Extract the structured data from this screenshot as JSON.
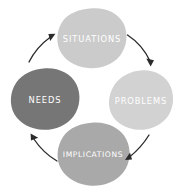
{
  "diagram": {
    "type": "cycle-diagram",
    "background_color": "#ffffff",
    "label_color": "#ffffff",
    "arrow_color": "#2b2b2b",
    "nodes": [
      {
        "id": "situations",
        "label": "SITUATIONS",
        "position": "top",
        "color": "#cbcbcb",
        "cx": 92,
        "cy": 38,
        "rx": 34,
        "ry": 30
      },
      {
        "id": "problems",
        "label": "PROBLEMS",
        "position": "right",
        "color": "#d2d2d2",
        "cx": 141,
        "cy": 100,
        "rx": 31,
        "ry": 30
      },
      {
        "id": "implications",
        "label": "IMPLICATIONS",
        "position": "bottom",
        "color": "#a9a9a9",
        "cx": 93,
        "cy": 154,
        "rx": 35,
        "ry": 31
      },
      {
        "id": "needs",
        "label": "NEEDS",
        "position": "left",
        "color": "#767676",
        "cx": 45,
        "cy": 99,
        "rx": 33,
        "ry": 31
      }
    ],
    "arrows": [
      {
        "id": "situations-to-problems",
        "from": "situations",
        "to": "problems"
      },
      {
        "id": "problems-to-implications",
        "from": "problems",
        "to": "implications"
      },
      {
        "id": "implications-to-needs",
        "from": "implications",
        "to": "needs"
      },
      {
        "id": "needs-to-situations",
        "from": "needs",
        "to": "situations"
      }
    ]
  }
}
